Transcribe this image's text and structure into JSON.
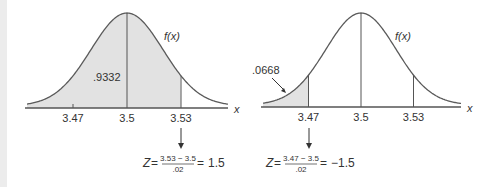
{
  "chart_data": [
    {
      "type": "area",
      "title": "",
      "distribution": "normal",
      "mean": 3.5,
      "sd": 0.02,
      "xlabel": "x",
      "curve_label": "f(x)",
      "xticks": [
        "3.47",
        "3.5",
        "3.53"
      ],
      "tick_values": [
        3.47,
        3.5,
        3.53
      ],
      "shaded_region": {
        "from": null,
        "to": 3.53,
        "area": 0.9332
      },
      "area_label": ".9332",
      "marked_value": 3.53,
      "formula": {
        "lhs": "Z",
        "numerator": "3.53 − 3.5",
        "denominator": ".02",
        "result": "1.5"
      }
    },
    {
      "type": "area",
      "title": "",
      "distribution": "normal",
      "mean": 3.5,
      "sd": 0.02,
      "xlabel": "x",
      "curve_label": "f(x)",
      "xticks": [
        "3.47",
        "3.5",
        "3.53"
      ],
      "tick_values": [
        3.47,
        3.5,
        3.53
      ],
      "shaded_region": {
        "from": null,
        "to": 3.47,
        "area": 0.0668
      },
      "area_label": ".0668",
      "marked_value": 3.47,
      "formula": {
        "lhs": "Z",
        "numerator": "3.47 − 3.5",
        "denominator": ".02",
        "result": "−1.5"
      }
    }
  ],
  "colors": {
    "curve": "#5a5a5a",
    "fill": "#e2e2e2",
    "axis": "#555555",
    "text": "#333333"
  }
}
